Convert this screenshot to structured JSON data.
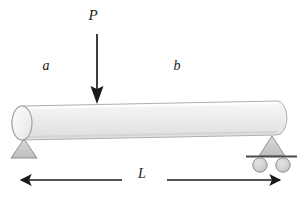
{
  "figure": {
    "background_color": "#ffffff",
    "width": 303,
    "height": 198
  },
  "labels": {
    "load": "P",
    "segment_left": "a",
    "segment_right": "b",
    "span": "L"
  },
  "colors": {
    "ink": "#1a1a1a",
    "beam_fill_light": "#f4f4f4",
    "beam_fill_mid": "#e6e6e6",
    "beam_outline": "#a8a8a8",
    "support_fill": "#c9c9c9",
    "support_outline": "#8c8c8c",
    "roller_fill": "#cfcfcf",
    "roller_outline": "#8c8c8c",
    "plate": "#4a4a4a"
  },
  "elements": {
    "load_arrow": {
      "name": "downward point load arrow",
      "x": 97,
      "y_start": 34,
      "y_end": 103
    },
    "beam": {
      "name": "cylindrical beam",
      "left_x": 13,
      "right_x": 287,
      "top_y": 104,
      "bottom_y": 137
    },
    "pin_support": {
      "name": "pin support triangle",
      "center_x": 24,
      "top_y": 138,
      "base_y": 158,
      "half_width": 13
    },
    "roller_support": {
      "name": "roller support",
      "center_x": 272,
      "triangle_top_y": 135,
      "plate_y": 156,
      "plate_left_x": 246,
      "plate_right_x": 297,
      "roller_radius": 7,
      "roller_left_cx": 260,
      "roller_right_cx": 283,
      "roller_cy": 165
    },
    "span_dimension": {
      "name": "span dimension line",
      "y": 180,
      "left_arrow_tip_x": 15,
      "left_arrow_tail_x": 122,
      "right_arrow_tail_x": 167,
      "right_arrow_tip_x": 286
    }
  },
  "label_positions": {
    "load": {
      "x": 93,
      "y": 20
    },
    "segment_left": {
      "x": 46,
      "y": 70
    },
    "segment_right": {
      "x": 177,
      "y": 70
    },
    "span": {
      "x": 140,
      "y": 177
    }
  }
}
